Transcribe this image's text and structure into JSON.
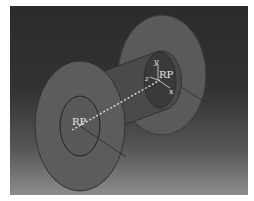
{
  "model": {
    "type": "spool",
    "reference_points": [
      {
        "label": "RP",
        "position": "front-flange-center"
      },
      {
        "label": "RP",
        "position": "rear-flange-center"
      }
    ],
    "axes": {
      "x": "x",
      "y": "y",
      "z": "z"
    }
  },
  "colors": {
    "background_top": "#2b2b2b",
    "background_bottom": "#8c8c8c",
    "part_fill": "#555555",
    "edge": "#222222",
    "label": "#e8e8e8"
  }
}
